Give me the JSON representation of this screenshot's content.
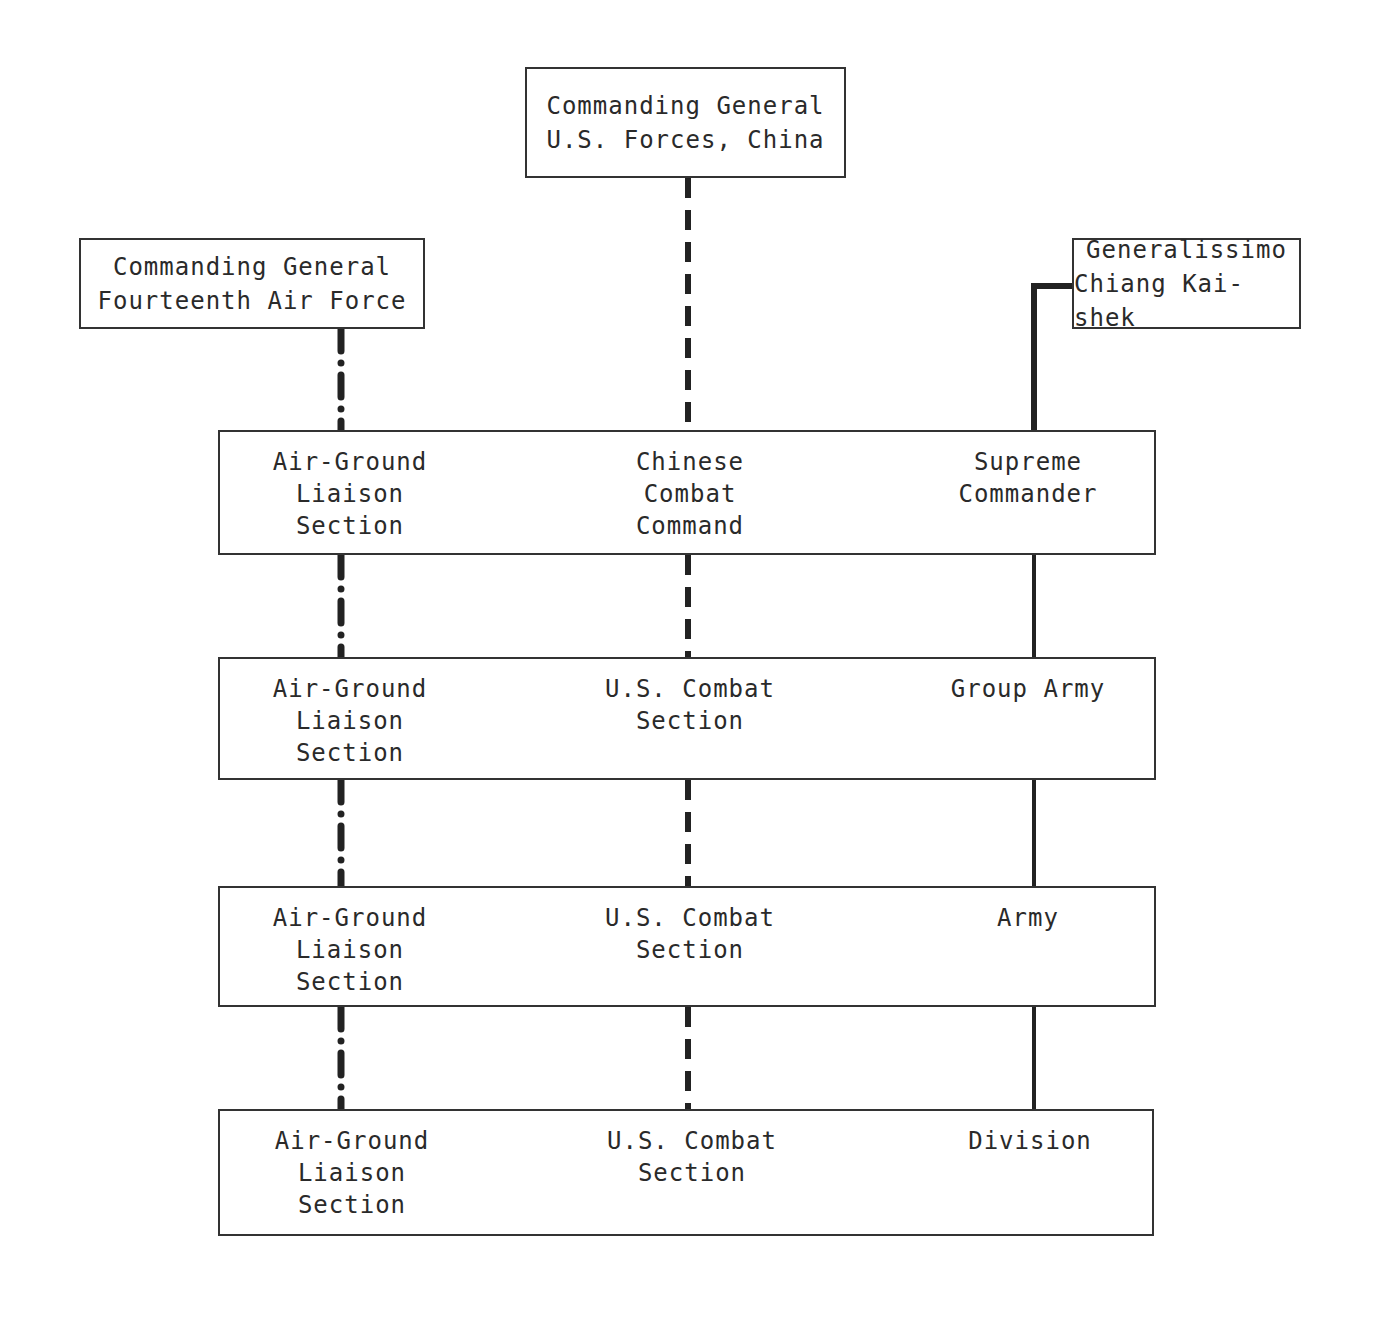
{
  "diagram": {
    "top_boxes": {
      "us_forces": [
        "Commanding General",
        "U.S. Forces, China"
      ],
      "fourteenth_af": [
        "Commanding General",
        "Fourteenth Air Force"
      ],
      "generalissimo": [
        "Generalissimo",
        "Chiang Kai-shek"
      ]
    },
    "rows": [
      {
        "left": [
          "Air-Ground",
          "Liaison",
          "Section"
        ],
        "center": [
          "Chinese",
          "Combat",
          "Command"
        ],
        "right": [
          "Supreme",
          "Commander"
        ]
      },
      {
        "left": [
          "Air-Ground",
          "Liaison",
          "Section"
        ],
        "center": [
          "U.S. Combat",
          "Section"
        ],
        "right": [
          "Group Army"
        ]
      },
      {
        "left": [
          "Air-Ground",
          "Liaison",
          "Section"
        ],
        "center": [
          "U.S. Combat",
          "Section"
        ],
        "right": [
          "Army"
        ]
      },
      {
        "left": [
          "Air-Ground",
          "Liaison",
          "Section"
        ],
        "center": [
          "U.S. Combat",
          "Section"
        ],
        "right": [
          "Division"
        ]
      }
    ],
    "connector_styles": {
      "fourteenth_af_chain": "dash-dot",
      "us_forces_chain": "dashed",
      "chinese_chain": "solid"
    }
  }
}
